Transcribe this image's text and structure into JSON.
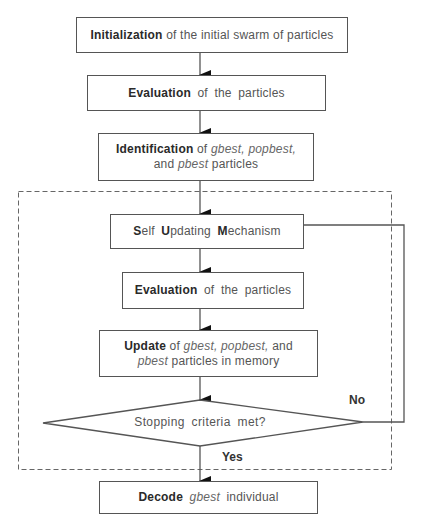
{
  "diagram": {
    "type": "flowchart",
    "nodes": {
      "init": {
        "bold": "Initialization",
        "rest": " of the initial swarm of particles"
      },
      "eval1": {
        "bold": "Evaluation",
        "rest": " of the particles"
      },
      "ident": {
        "bold": "Identification",
        "of": " of ",
        "gbest": "gbest,",
        "popbest": "popbest,",
        "and": "and ",
        "pbest": "pbest",
        "particles": " particles"
      },
      "self_update": {
        "s1b": "S",
        "s1": "elf ",
        "s2b": "U",
        "s2": "pdating ",
        "s3b": "M",
        "s3": "echanism"
      },
      "eval2": {
        "bold": "Evaluation",
        "rest": " of the particles"
      },
      "update": {
        "bold": "Update",
        "of": " of ",
        "gbest": "gbest,",
        "popbest": "popbest,",
        "and": " and",
        "pbest": "pbest",
        "rest": " particles in memory"
      },
      "decision": {
        "text": "Stopping criteria met?"
      },
      "decode": {
        "bold": "Decode",
        "gbest": "gbest",
        "rest": " individual"
      }
    },
    "edges": {
      "no_label": "No",
      "yes_label": "Yes"
    },
    "colors": {
      "line": "#555555",
      "text": "#555555",
      "bold_text": "#2a2a2a"
    }
  }
}
